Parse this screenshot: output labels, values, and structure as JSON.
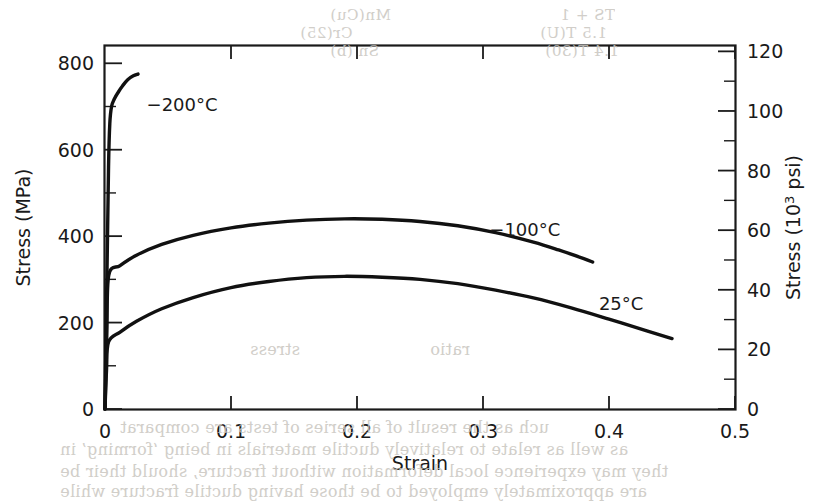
{
  "figure": {
    "background_color": "#ffffff",
    "ink_color": "#111111",
    "bleed_text_color": "#c9c6c0"
  },
  "axes": {
    "left": {
      "title": "Stress (MPa)",
      "tick_labels": [
        "0",
        "200",
        "400",
        "600",
        "800"
      ],
      "tick_values": [
        0,
        200,
        400,
        600,
        800
      ],
      "minor_tick_values": [
        100,
        300,
        500,
        700
      ],
      "min": 0,
      "max": 840
    },
    "right": {
      "title_prefix": "Stress (10",
      "title_sup": "3",
      "title_suffix": " psi)",
      "title": "Stress (10³ psi)",
      "tick_labels": [
        "0",
        "20",
        "40",
        "60",
        "80",
        "100",
        "120"
      ],
      "tick_values": [
        0,
        20,
        40,
        60,
        80,
        100,
        120
      ],
      "minor_tick_values": [
        10,
        30,
        50,
        70,
        90,
        110
      ],
      "min": 0,
      "max": 121.8
    },
    "bottom": {
      "title": "Strain",
      "tick_labels": [
        "0",
        "0.1",
        "0.2",
        "0.3",
        "0.4",
        "0.5"
      ],
      "tick_values": [
        0,
        0.1,
        0.2,
        0.3,
        0.4,
        0.5
      ],
      "min": 0,
      "max": 0.5
    }
  },
  "chart_data": {
    "type": "line",
    "title": "",
    "xlabel": "Strain",
    "ylabel": "Stress (MPa)",
    "ylabel_secondary": "Stress (10³ psi)",
    "xlim": [
      0,
      0.5
    ],
    "ylim": [
      0,
      840
    ],
    "ylim_secondary": [
      0,
      121.8
    ],
    "grid": false,
    "legend": "inline-curve-labels",
    "series": [
      {
        "name": "-200°C",
        "label": "−200°C",
        "label_x": 0.033,
        "label_y": 690,
        "color": "#111111",
        "points": [
          [
            0.0,
            0
          ],
          [
            0.0015,
            300
          ],
          [
            0.0028,
            560
          ],
          [
            0.0038,
            660
          ],
          [
            0.0052,
            700
          ],
          [
            0.0075,
            718
          ],
          [
            0.0105,
            733
          ],
          [
            0.014,
            748
          ],
          [
            0.018,
            762
          ],
          [
            0.0225,
            771
          ],
          [
            0.0262,
            775
          ]
        ]
      },
      {
        "name": "-100°C",
        "label": "−100°C",
        "label_x": 0.305,
        "label_y": 400,
        "color": "#111111",
        "points": [
          [
            0.0,
            0
          ],
          [
            0.0015,
            180
          ],
          [
            0.003,
            310
          ],
          [
            0.012,
            332
          ],
          [
            0.025,
            356
          ],
          [
            0.045,
            381
          ],
          [
            0.07,
            402
          ],
          [
            0.1,
            419
          ],
          [
            0.13,
            430
          ],
          [
            0.16,
            437
          ],
          [
            0.19,
            440
          ],
          [
            0.22,
            439
          ],
          [
            0.25,
            434
          ],
          [
            0.28,
            424
          ],
          [
            0.31,
            408
          ],
          [
            0.34,
            386
          ],
          [
            0.36,
            368
          ],
          [
            0.38,
            348
          ],
          [
            0.387,
            340
          ]
        ]
      },
      {
        "name": "25°C",
        "label": "25°C",
        "label_x": 0.392,
        "label_y": 228,
        "color": "#111111",
        "points": [
          [
            0.0,
            0
          ],
          [
            0.0012,
            90
          ],
          [
            0.0028,
            155
          ],
          [
            0.012,
            178
          ],
          [
            0.025,
            203
          ],
          [
            0.045,
            232
          ],
          [
            0.07,
            258
          ],
          [
            0.1,
            281
          ],
          [
            0.13,
            295
          ],
          [
            0.16,
            304
          ],
          [
            0.19,
            307
          ],
          [
            0.22,
            305
          ],
          [
            0.25,
            300
          ],
          [
            0.28,
            290
          ],
          [
            0.31,
            275
          ],
          [
            0.34,
            257
          ],
          [
            0.37,
            234
          ],
          [
            0.4,
            208
          ],
          [
            0.43,
            181
          ],
          [
            0.45,
            163
          ]
        ]
      }
    ]
  },
  "bleed_text": {
    "top": [
      {
        "text": "Mn(Cu)",
        "x": 330,
        "y": 6,
        "size": 15
      },
      {
        "text": "TS + 1",
        "x": 560,
        "y": 6,
        "size": 15
      },
      {
        "text": "Cr(25)",
        "x": 300,
        "y": 24,
        "size": 15
      },
      {
        "text": "1.5 T(U)",
        "x": 540,
        "y": 24,
        "size": 15
      },
      {
        "text": "Sn (b)",
        "x": 330,
        "y": 42,
        "size": 15
      },
      {
        "text": "1.4 T(30)",
        "x": 545,
        "y": 42,
        "size": 15
      }
    ],
    "bottom": [
      {
        "text": "uch as the result of all series of tests are comparat",
        "x": 120,
        "y": 418,
        "size": 16
      },
      {
        "text": "as well as relate to relatively ductile materials in being ‘forming’ in",
        "x": 60,
        "y": 440,
        "size": 16
      },
      {
        "text": "they may experience local deformation without fracture, should their be",
        "x": 60,
        "y": 462,
        "size": 16
      },
      {
        "text": "are approximately employed to be those having ductile fracture while",
        "x": 60,
        "y": 482,
        "size": 16
      }
    ],
    "middle": [
      {
        "text": "stress",
        "x": 250,
        "y": 340,
        "size": 16
      },
      {
        "text": "ratio",
        "x": 430,
        "y": 340,
        "size": 16
      }
    ]
  }
}
